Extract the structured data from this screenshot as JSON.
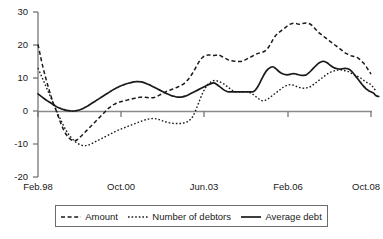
{
  "chart_data": {
    "type": "line",
    "title": "",
    "subtitle": "",
    "xlabel": "",
    "ylabel": "",
    "ylim": [
      -20,
      30
    ],
    "yticks": [
      30,
      20,
      10,
      0,
      -10,
      -20
    ],
    "xticks": [
      "Feb.98",
      "Oct.00",
      "Jun.03",
      "Feb.06",
      "Oct.08"
    ],
    "xtick_index": [
      0,
      32,
      64,
      96,
      128
    ],
    "grid": false,
    "zero_line": true,
    "legend_position": "bottom",
    "x_count": 129,
    "series": [
      {
        "name": "Amount",
        "style": "dashed",
        "color": "#1a1a1a",
        "values": [
          20.2,
          16.5,
          13.0,
          10.0,
          7.2,
          4.6,
          2.2,
          0.2,
          -2.0,
          -4.0,
          -5.8,
          -7.2,
          -8.2,
          -8.8,
          -9.0,
          -8.8,
          -8.2,
          -7.4,
          -6.6,
          -5.8,
          -5.0,
          -4.2,
          -3.4,
          -2.6,
          -1.8,
          -1.0,
          -0.2,
          0.6,
          1.2,
          1.8,
          2.2,
          2.6,
          2.8,
          3.0,
          3.2,
          3.4,
          3.6,
          3.8,
          4.0,
          4.1,
          4.2,
          4.2,
          4.1,
          4.0,
          4.0,
          4.1,
          4.4,
          4.8,
          5.2,
          5.6,
          6.0,
          6.3,
          6.6,
          6.9,
          7.2,
          7.6,
          8.0,
          8.6,
          9.4,
          10.4,
          11.6,
          13.0,
          14.4,
          15.6,
          16.4,
          16.8,
          17.0,
          16.9,
          16.8,
          16.9,
          17.0,
          16.6,
          16.2,
          15.8,
          15.4,
          15.2,
          15.1,
          15.0,
          15.0,
          15.1,
          15.4,
          15.8,
          16.2,
          16.6,
          17.0,
          17.4,
          17.6,
          17.8,
          18.2,
          19.0,
          20.2,
          21.6,
          22.8,
          23.6,
          24.2,
          24.8,
          25.4,
          26.0,
          26.4,
          26.6,
          26.5,
          26.3,
          26.4,
          26.6,
          26.7,
          26.5,
          26.0,
          25.2,
          24.4,
          23.6,
          23.0,
          22.4,
          21.8,
          21.2,
          20.6,
          20.0,
          19.4,
          18.8,
          18.2,
          17.6,
          17.2,
          16.8,
          16.6,
          16.4,
          16.0,
          15.4,
          14.6,
          13.6,
          12.4,
          11.2
        ]
      },
      {
        "name": "Number of debtors",
        "style": "dotted",
        "color": "#1a1a1a",
        "values": [
          13.0,
          11.2,
          9.4,
          7.6,
          5.8,
          4.0,
          2.2,
          0.4,
          -1.4,
          -3.0,
          -4.6,
          -6.0,
          -7.2,
          -8.2,
          -9.0,
          -9.6,
          -10.1,
          -10.4,
          -10.5,
          -10.4,
          -10.2,
          -9.8,
          -9.4,
          -9.0,
          -8.6,
          -8.2,
          -7.8,
          -7.4,
          -7.0,
          -6.6,
          -6.2,
          -5.8,
          -5.5,
          -5.2,
          -4.9,
          -4.6,
          -4.3,
          -4.0,
          -3.7,
          -3.4,
          -3.1,
          -2.8,
          -2.6,
          -2.4,
          -2.3,
          -2.3,
          -2.4,
          -2.6,
          -2.9,
          -3.2,
          -3.4,
          -3.6,
          -3.7,
          -3.8,
          -3.8,
          -3.8,
          -3.7,
          -3.5,
          -3.2,
          -2.6,
          -1.6,
          0.0,
          2.0,
          4.0,
          5.8,
          7.2,
          8.2,
          8.8,
          9.2,
          9.2,
          9.0,
          8.6,
          8.2,
          7.6,
          7.0,
          6.4,
          6.0,
          5.8,
          5.8,
          5.8,
          5.8,
          5.8,
          5.6,
          5.2,
          4.6,
          4.0,
          3.4,
          3.1,
          3.2,
          3.6,
          4.2,
          4.8,
          5.4,
          6.0,
          6.6,
          7.2,
          7.6,
          7.9,
          8.0,
          7.8,
          7.5,
          7.2,
          7.0,
          6.9,
          7.0,
          7.2,
          7.6,
          8.2,
          8.8,
          9.4,
          10.0,
          10.6,
          11.2,
          11.6,
          12.0,
          12.2,
          12.4,
          12.5,
          12.4,
          12.2,
          12.0,
          11.6,
          11.2,
          10.8,
          10.4,
          10.0,
          9.4,
          8.8,
          8.4,
          8.0,
          7.0,
          6.0
        ]
      },
      {
        "name": "Average debt",
        "style": "solid",
        "color": "#1a1a1a",
        "values": [
          5.2,
          4.6,
          4.0,
          3.4,
          2.9,
          2.4,
          1.9,
          1.4,
          1.0,
          0.7,
          0.4,
          0.2,
          0.1,
          0.0,
          0.0,
          0.1,
          0.3,
          0.6,
          1.0,
          1.4,
          1.9,
          2.4,
          2.9,
          3.4,
          3.9,
          4.4,
          4.9,
          5.4,
          5.9,
          6.4,
          6.8,
          7.2,
          7.6,
          7.9,
          8.2,
          8.4,
          8.6,
          8.8,
          8.9,
          8.9,
          8.8,
          8.6,
          8.3,
          8.0,
          7.6,
          7.2,
          6.8,
          6.4,
          6.0,
          5.6,
          5.2,
          4.9,
          4.6,
          4.4,
          4.2,
          4.2,
          4.3,
          4.5,
          4.8,
          5.2,
          5.6,
          6.0,
          6.4,
          6.8,
          7.2,
          7.6,
          8.0,
          8.3,
          8.5,
          8.2,
          7.6,
          7.0,
          6.4,
          6.0,
          5.8,
          5.8,
          5.8,
          5.8,
          5.8,
          5.8,
          5.8,
          5.8,
          5.8,
          5.8,
          6.2,
          7.2,
          8.6,
          10.2,
          11.6,
          12.6,
          13.2,
          13.4,
          12.9,
          12.2,
          11.6,
          11.2,
          11.0,
          11.0,
          11.2,
          11.3,
          11.2,
          11.0,
          10.8,
          10.8,
          11.0,
          11.6,
          12.4,
          13.2,
          14.0,
          14.6,
          15.0,
          15.0,
          14.6,
          14.0,
          13.4,
          13.0,
          12.8,
          12.7,
          12.8,
          12.9,
          12.8,
          12.4,
          11.6,
          10.6,
          9.6,
          8.6,
          7.6,
          6.8,
          6.2,
          5.8,
          5.4,
          4.6,
          4.4
        ]
      }
    ]
  },
  "axis": {
    "y_labels": [
      "30",
      "20",
      "10",
      "0",
      "-10",
      "-20"
    ],
    "x_labels": [
      "Feb.98",
      "Oct.00",
      "Jun.03",
      "Feb.06",
      "Oct.08"
    ]
  },
  "legend": {
    "items": [
      {
        "label": "Amount",
        "style": "dashed"
      },
      {
        "label": "Number of debtors",
        "style": "dotted"
      },
      {
        "label": "Average debt",
        "style": "solid"
      }
    ]
  },
  "colors": {
    "line": "#1a1a1a",
    "axis": "#6b6b6b",
    "zero_line": "#8a8a8a",
    "background": "#ffffff"
  }
}
